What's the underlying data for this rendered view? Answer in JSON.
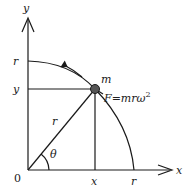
{
  "diagram": {
    "axes": {
      "x_label": "x",
      "y_label": "y",
      "origin_label": "0"
    },
    "labels": {
      "y_axis_r": "r",
      "y_axis_y": "y",
      "x_axis_x": "x",
      "x_axis_r": "r",
      "radius": "r",
      "angle": "θ",
      "mass": "m",
      "force_F": "F",
      "force_eq": "=",
      "force_expr": "mrω",
      "force_exp": "2"
    },
    "colors": {
      "line": "#1a1a1a",
      "mass_fill": "#555555"
    }
  }
}
